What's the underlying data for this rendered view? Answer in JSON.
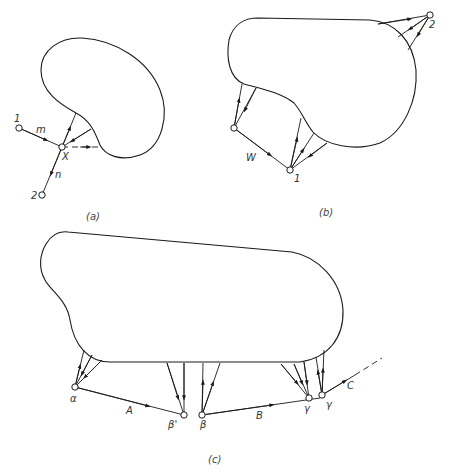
{
  "figure": {
    "panels": [
      {
        "id": "a",
        "caption": "(a)",
        "nodes": [
          {
            "id": "1",
            "label": "1"
          },
          {
            "id": "X",
            "label": "X"
          },
          {
            "id": "2",
            "label": "2"
          }
        ],
        "edge_labels": {
          "m": "m",
          "n": "n"
        }
      },
      {
        "id": "b",
        "caption": "(b)",
        "nodes": [
          {
            "id": "1",
            "label": "1"
          },
          {
            "id": "2",
            "label": "2"
          },
          {
            "id": "unlabeled",
            "label": ""
          }
        ],
        "edge_labels": {
          "W": "W"
        }
      },
      {
        "id": "c",
        "caption": "(c)",
        "nodes": [
          {
            "id": "alpha",
            "label": "α"
          },
          {
            "id": "beta_prime",
            "label": "β'"
          },
          {
            "id": "beta",
            "label": "β"
          },
          {
            "id": "gamma1",
            "label": "γ"
          },
          {
            "id": "gamma2",
            "label": "γ"
          }
        ],
        "edge_labels": {
          "A": "A",
          "B": "B",
          "C": "C"
        }
      }
    ]
  }
}
